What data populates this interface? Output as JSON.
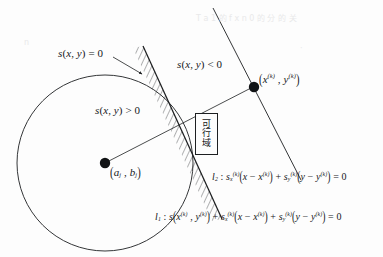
{
  "figure": {
    "type": "geometry-diagram",
    "caption_language": "zh-CN",
    "background_color": "#fdfdfd",
    "stroke_color": "#1d1f21",
    "canvas": {
      "width": 383,
      "height": 257
    }
  },
  "labels": {
    "constraint_zero": "s(x, y) = 0",
    "constraint_negative": "s(x, y) < 0",
    "constraint_positive": "s(x, y) > 0",
    "point_k": "(x⁽ᵏ⁾ , y⁽ᵏ⁾)",
    "circle_center": "(a_j , b_j)",
    "line_l1": "l₁ : s(x⁽ᵏ⁾, y⁽ᵏ⁾) + s_x⁽ᵏ⁾(x − x⁽ᵏ⁾) + s_y⁽ᵏ⁾(y − y⁽ᵏ⁾) = 0",
    "line_l2": "l₂ : s_x⁽ᵏ⁾(x − x⁽ᵏ⁾) + s_y⁽ᵏ⁾(y − y⁽ᵏ⁾) = 0"
  },
  "feasible_region": {
    "chars": [
      "可",
      "行",
      "域"
    ],
    "meaning": "feasible region"
  },
  "geometry": {
    "circle": {
      "cx": 105,
      "cy": 163,
      "r": 88
    },
    "center_dot": {
      "cx": 105,
      "cy": 163,
      "r": 5
    },
    "point_k_dot": {
      "cx": 254,
      "cy": 87,
      "r": 5
    },
    "radius_segment": {
      "x1": 105,
      "y1": 163,
      "x2": 251,
      "y2": 88
    },
    "hatched_line_l1": {
      "x1": 143,
      "y1": 46,
      "x2": 222,
      "y2": 219
    },
    "line_l2": {
      "x1": 213,
      "y1": 8,
      "x2": 301,
      "y2": 180
    },
    "arrow_to_boundary": {
      "x1": 113,
      "y1": 57,
      "x2": 143,
      "y2": 74
    }
  },
  "bleed_through": [
    {
      "text": "T a 1 的 f x n 0 的 分 的 关",
      "x": 196,
      "y": 12
    },
    {
      "text": "n",
      "x": 24,
      "y": 38
    },
    {
      "text": "·",
      "x": 300,
      "y": 44
    }
  ]
}
